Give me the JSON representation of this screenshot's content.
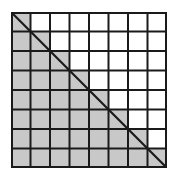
{
  "diagram": {
    "rows": 8,
    "cols": 8,
    "shading_rule": "cells on or below the main diagonal are shaded",
    "shaded_color": "#c8c8c8",
    "unshaded_color": "#ffffff",
    "line_color": "#1a1a1a",
    "diagonal": {
      "from": "top-left",
      "to": "bottom-right"
    },
    "shaded_cell_count": 36,
    "total_cell_count": 64
  }
}
